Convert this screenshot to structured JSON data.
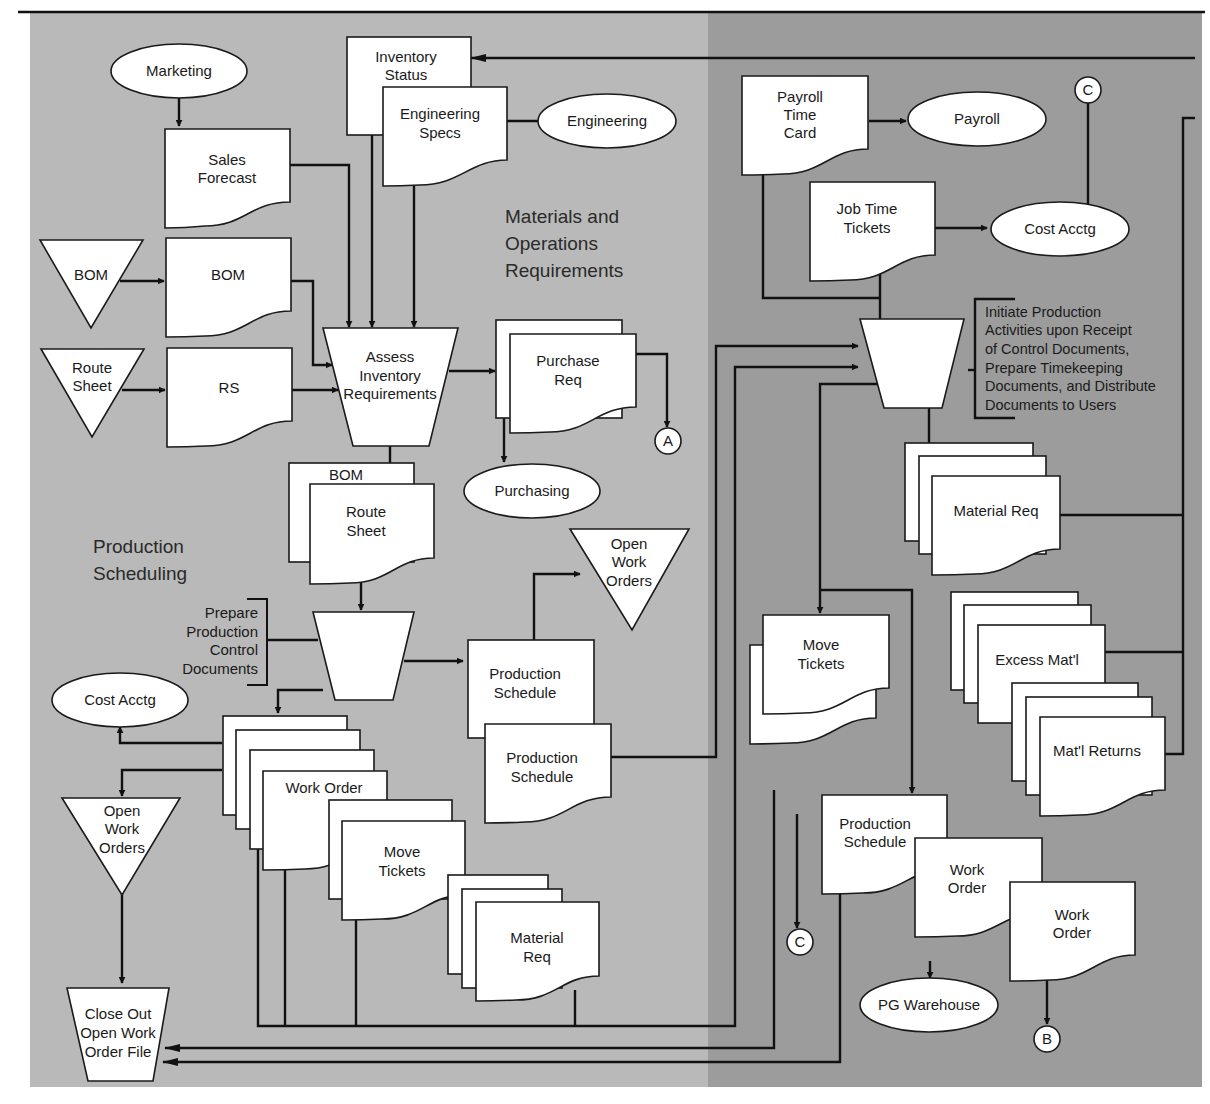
{
  "colors": {
    "left_panel": "#b9b9b9",
    "right_panel": "#9c9c9c",
    "shape_fill": "#ffffff",
    "line": "#111111"
  },
  "sections": {
    "materials": [
      "Materials and",
      "Operations",
      "Requirements"
    ],
    "production_scheduling": [
      "Production",
      "Scheduling"
    ]
  },
  "nodes": {
    "marketing": "Marketing",
    "sales_forecast": [
      "Sales",
      "Forecast"
    ],
    "inventory_status": [
      "Inventory",
      "Status"
    ],
    "engineering_specs": [
      "Engineering",
      "Specs"
    ],
    "engineering": "Engineering",
    "bom_file": "BOM",
    "bom_doc": "BOM",
    "route_sheet_file": [
      "Route",
      "Sheet"
    ],
    "rs_doc": "RS",
    "assess": [
      "Assess",
      "Inventory",
      "Requirements"
    ],
    "purchase_req": [
      "Purchase",
      "Req"
    ],
    "connector_a": "A",
    "purchasing": "Purchasing",
    "bom_doc2": "BOM",
    "route_sheet_doc": [
      "Route",
      "Sheet"
    ],
    "prepare_annotation": [
      "Prepare",
      "Production",
      "Control",
      "Documents"
    ],
    "open_work_orders_file": [
      "Open",
      "Work",
      "Orders"
    ],
    "production_schedule_1": [
      "Production",
      "Schedule"
    ],
    "production_schedule_2": [
      "Production",
      "Schedule"
    ],
    "cost_acctg_left": "Cost Acctg",
    "open_work_orders_left": [
      "Open",
      "Work",
      "Orders"
    ],
    "work_order_stack": "Work Order",
    "move_tickets_left": [
      "Move",
      "Tickets"
    ],
    "material_req_left": [
      "Material",
      "Req"
    ],
    "close_out": [
      "Close Out",
      "Open Work",
      "Order File"
    ],
    "payroll_time_card": [
      "Payroll",
      "Time",
      "Card"
    ],
    "payroll": "Payroll",
    "connector_c_top": "C",
    "job_time_tickets": [
      "Job Time",
      "Tickets"
    ],
    "cost_acctg_right": "Cost Acctg",
    "initiate_annotation": [
      "Initiate Production",
      "Activities upon Receipt",
      "of Control Documents,",
      "Prepare Timekeeping",
      "Documents, and Distribute",
      "Documents to Users"
    ],
    "material_req_right": "Material Req",
    "excess_matl": "Excess Mat'l",
    "matl_returns": "Mat'l Returns",
    "move_tickets_right": [
      "Move",
      "Tickets"
    ],
    "production_schedule_right": [
      "Production",
      "Schedule"
    ],
    "work_order_right_1": [
      "Work",
      "Order"
    ],
    "work_order_right_2": [
      "Work",
      "Order"
    ],
    "connector_c_bottom": "C",
    "pg_warehouse": "PG Warehouse",
    "connector_b": "B"
  }
}
